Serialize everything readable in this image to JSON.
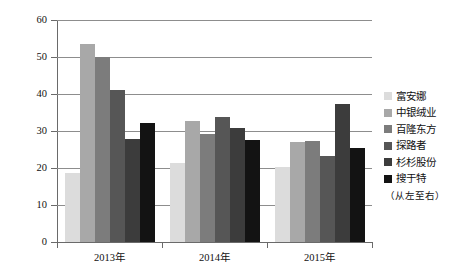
{
  "chart_data": {
    "type": "bar",
    "title": "",
    "subtitle": "",
    "xlabel": "",
    "ylabel": "",
    "categories": [
      "2013年",
      "2014年",
      "2015年"
    ],
    "ylim": [
      0,
      60
    ],
    "yticks": [
      0,
      10,
      20,
      30,
      40,
      50,
      60
    ],
    "ytick_labels": [
      "0",
      "10",
      "20",
      "30",
      "40",
      "50",
      "60"
    ],
    "grid": true,
    "legend_position": "right",
    "legend_note": "（从左至右）",
    "series": [
      {
        "name": "富安娜",
        "color": "#dcdcdc",
        "values": [
          18.7,
          21.3,
          20.4
        ]
      },
      {
        "name": "中银绒业",
        "color": "#a8a8a8",
        "values": [
          53.5,
          32.8,
          27.1
        ]
      },
      {
        "name": "百隆东方",
        "color": "#7c7c7c",
        "values": [
          50.0,
          29.3,
          27.4
        ]
      },
      {
        "name": "探路者",
        "color": "#565656",
        "values": [
          41.2,
          33.9,
          23.3
        ]
      },
      {
        "name": "杉杉股份",
        "color": "#3c3c3c",
        "values": [
          27.8,
          30.7,
          37.2
        ]
      },
      {
        "name": "搜于特",
        "color": "#131313",
        "values": [
          32.2,
          27.6,
          25.3
        ]
      }
    ]
  }
}
